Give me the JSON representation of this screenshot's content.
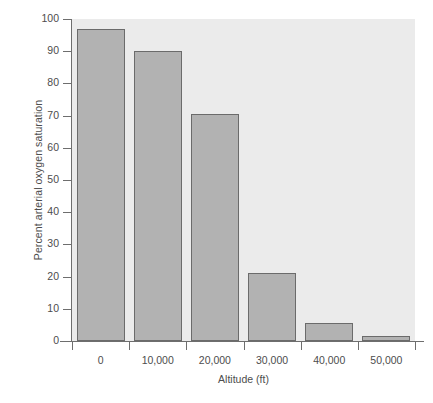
{
  "chart_data": {
    "type": "bar",
    "title": "",
    "xlabel": "Altitude (ft)",
    "ylabel": "Percent arterial oxygen saturation",
    "categories": [
      "0",
      "10,000",
      "20,000",
      "30,000",
      "40,000",
      "50,000"
    ],
    "x_values": [
      0,
      10000,
      20000,
      30000,
      40000,
      50000
    ],
    "values": [
      97,
      90,
      70.5,
      21,
      5.5,
      1.5
    ],
    "series": [
      {
        "name": "Percent arterial oxygen saturation",
        "values": [
          97,
          90,
          70.5,
          21,
          5.5,
          1.5
        ]
      }
    ],
    "ylim": [
      0,
      100
    ],
    "y_ticks": [
      0,
      10,
      20,
      30,
      40,
      50,
      60,
      70,
      80,
      90,
      100
    ],
    "y_tick_labels": [
      "0",
      "10",
      "20",
      "30",
      "40",
      "50",
      "60",
      "70",
      "80",
      "90",
      "100"
    ],
    "grid": false,
    "legend": false,
    "legend_position": "none",
    "bar_color": "#b2b2b2",
    "bar_edge_color": "#6b6b6b",
    "plot_background": "#ebebeb",
    "axis_color": "#6e6e6e",
    "text_color": "#4d4d4d"
  }
}
